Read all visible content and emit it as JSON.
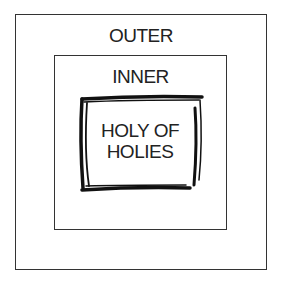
{
  "diagram": {
    "type": "nested-boxes",
    "outer": {
      "label": "OUTER"
    },
    "inner": {
      "label": "INNER"
    },
    "core": {
      "label_line1": "HOLY OF",
      "label_line2": "HOLIES",
      "style": "hand-drawn thick border"
    },
    "colors": {
      "stroke": "#222222",
      "background": "#ffffff"
    }
  }
}
